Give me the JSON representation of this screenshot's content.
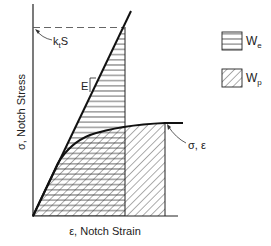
{
  "diagram": {
    "y_axis_label": "σ, Notch Stress",
    "x_axis_label": "ε, Notch Strain",
    "elastic_line_label": "E",
    "elastic_stress_label_main": "k",
    "elastic_stress_label_sub": "t",
    "elastic_stress_label_tail": "S",
    "curve_point_label": "σ, ε",
    "legend": [
      {
        "symbol": "W",
        "subscript": "e",
        "pattern": "horizontal-hatch"
      },
      {
        "symbol": "W",
        "subscript": "p",
        "pattern": "diagonal-hatch"
      }
    ],
    "colors": {
      "line": "#111111",
      "hatch": "#333333",
      "dashed": "#555555",
      "background": "#ffffff"
    }
  }
}
